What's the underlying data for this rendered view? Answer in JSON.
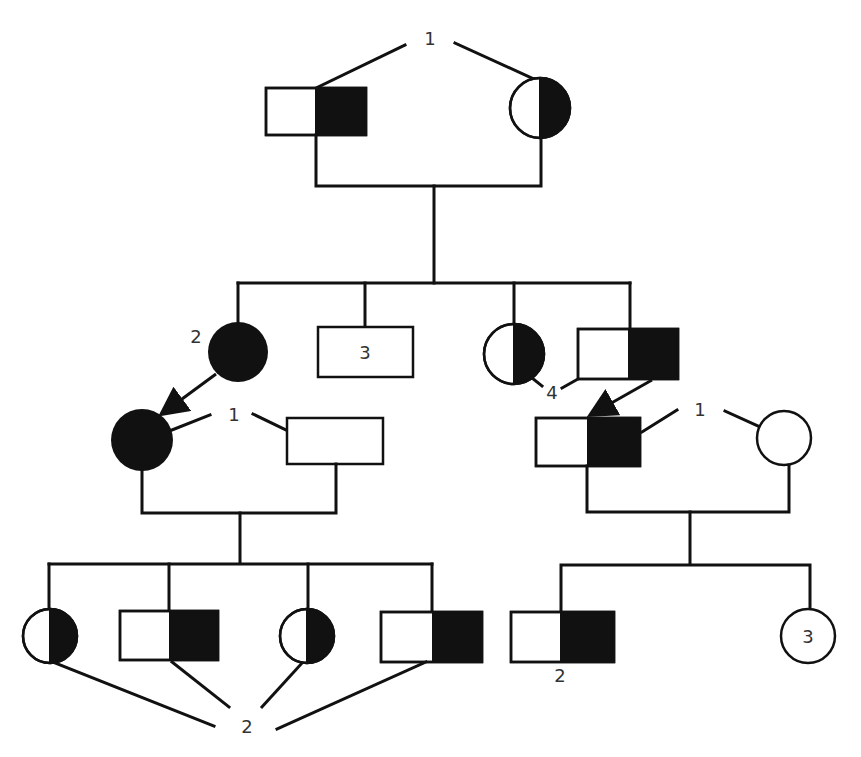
{
  "figure": {
    "type": "pedigree-chart",
    "colors": {
      "ink": "#111111",
      "background": "#ffffff",
      "label": "#333333"
    }
  },
  "labels": {
    "gen1_couple_marker": "1",
    "gen2_daughter_count": "2",
    "gen2_son_count": "3",
    "gen2_twin_marker": "4",
    "gen3_left_couple_marker": "1",
    "gen3_right_couple_marker": "1",
    "gen4_left_group_count": "2",
    "gen4_right_son_count": "2",
    "gen4_right_daughter_count": "3"
  },
  "individuals": [
    {
      "id": "I-1",
      "generation": 1,
      "sex": "male",
      "status": "carrier-half-filled"
    },
    {
      "id": "I-2",
      "generation": 1,
      "sex": "female",
      "status": "carrier-half-filled"
    },
    {
      "id": "II-1",
      "generation": 2,
      "sex": "female",
      "status": "affected",
      "count": "2"
    },
    {
      "id": "II-2",
      "generation": 2,
      "sex": "male",
      "status": "unaffected",
      "count": "3"
    },
    {
      "id": "II-3",
      "generation": 2,
      "sex": "female",
      "status": "carrier-half-filled"
    },
    {
      "id": "II-4",
      "generation": 2,
      "sex": "male",
      "status": "carrier-half-filled"
    },
    {
      "id": "III-1",
      "generation": 3,
      "sex": "female",
      "status": "affected"
    },
    {
      "id": "III-2",
      "generation": 3,
      "sex": "male",
      "status": "unaffected"
    },
    {
      "id": "III-3",
      "generation": 3,
      "sex": "male",
      "status": "carrier-half-filled"
    },
    {
      "id": "III-4",
      "generation": 3,
      "sex": "female",
      "status": "unaffected"
    },
    {
      "id": "IV-1",
      "generation": 4,
      "sex": "female",
      "status": "carrier-half-filled"
    },
    {
      "id": "IV-2",
      "generation": 4,
      "sex": "male",
      "status": "carrier-half-filled"
    },
    {
      "id": "IV-3",
      "generation": 4,
      "sex": "female",
      "status": "carrier-half-filled"
    },
    {
      "id": "IV-4",
      "generation": 4,
      "sex": "male",
      "status": "carrier-half-filled"
    },
    {
      "id": "IV-5",
      "generation": 4,
      "sex": "male",
      "status": "carrier-half-filled",
      "count": "2"
    },
    {
      "id": "IV-6",
      "generation": 4,
      "sex": "female",
      "status": "unaffected",
      "count": "3"
    }
  ]
}
